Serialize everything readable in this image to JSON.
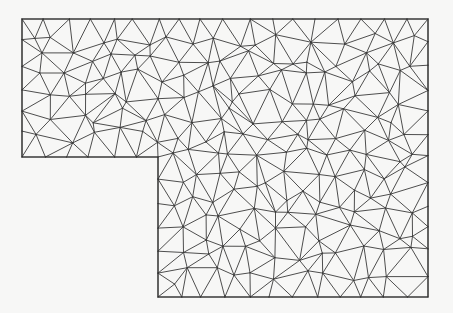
{
  "figure": {
    "title": "L-shaped domain triangular mesh",
    "type": "unstructured-triangular-mesh",
    "colors": {
      "background": "#f7f7f6",
      "edge": "#3a3a3a",
      "boundary": "#2e2e2e"
    },
    "domain_outline": [
      [
        22,
        19
      ],
      [
        428,
        19
      ],
      [
        428,
        297
      ],
      [
        158,
        297
      ],
      [
        158,
        157
      ],
      [
        22,
        157
      ]
    ],
    "mesh": {
      "target_edge_length": 22.5,
      "jitter": 0.38,
      "seed": 7
    }
  }
}
